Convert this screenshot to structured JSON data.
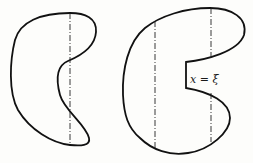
{
  "figure": {
    "colors": {
      "background": "#fdfdfb",
      "outline": "#111111",
      "dashed_line": "#222222"
    },
    "left_region": {
      "shape": "crescent-shaped closed curve with inward notch on right side",
      "cut_lines": 1
    },
    "right_region": {
      "shape": "C-shaped closed curve with rectangular slot on right side",
      "cut_lines": 2,
      "slot_label": "x = ξ"
    }
  }
}
